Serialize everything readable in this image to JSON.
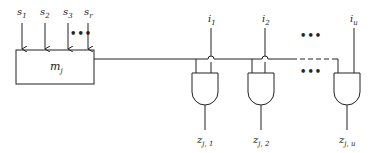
{
  "inputs": [
    {
      "label": "s",
      "sub": "1"
    },
    {
      "label": "s",
      "sub": "2"
    },
    {
      "label": "s",
      "sub": "3"
    },
    {
      "label": "s",
      "sub": "r"
    }
  ],
  "module": {
    "label": "m",
    "sub": "j"
  },
  "gate_inputs": [
    {
      "label": "i",
      "sub": "1"
    },
    {
      "label": "i",
      "sub": "2"
    },
    {
      "label": "i",
      "sub": "u"
    }
  ],
  "outputs": [
    {
      "label": "z",
      "sub": "j, 1"
    },
    {
      "label": "z",
      "sub": "j, 2"
    },
    {
      "label": "z",
      "sub": "j, u"
    }
  ],
  "ellipsis": "•••",
  "colors": {
    "stroke": "#222222",
    "background": "#ffffff"
  }
}
